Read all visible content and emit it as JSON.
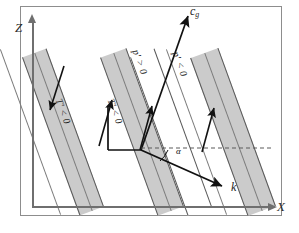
{
  "figure": {
    "kind": "internal-gravity-wave-phase-line-schematic",
    "background": "#ffffff",
    "frame_color": "#8d8d8d",
    "width": 299,
    "height": 233
  },
  "axes": {
    "vertical": {
      "label": "Z",
      "color": "#6f6f6f",
      "arrow": "up"
    },
    "horizontal": {
      "label": "X",
      "color": "#6f6f6f",
      "arrow": "right"
    }
  },
  "bands": {
    "fill": "#cbcbcb",
    "edge": "#585858",
    "tilt_degrees": -21,
    "items": [
      {
        "id": "band-left",
        "shaded": true
      },
      {
        "id": "band-middle",
        "shaded": true
      },
      {
        "id": "band-right",
        "shaded": true
      }
    ]
  },
  "vectors": {
    "group_velocity": {
      "label": "c",
      "sub": "g",
      "direction": "up-right",
      "color": "#111111"
    },
    "wave_vector": {
      "label": "k",
      "direction": "down-right",
      "color": "#111111"
    }
  },
  "angle": {
    "label": "α",
    "between": "wave-vector-and-horizontal"
  },
  "annotations": {
    "pressure_positive": "p′ > 0",
    "pressure_negative": "p′ < 0",
    "temperature_negative_left": "T′ < 0",
    "temperature_negative_middle": "T′ < 0"
  },
  "dashed_reference": {
    "style": "dashed",
    "color": "#5a5a5a",
    "orientation": "horizontal"
  }
}
